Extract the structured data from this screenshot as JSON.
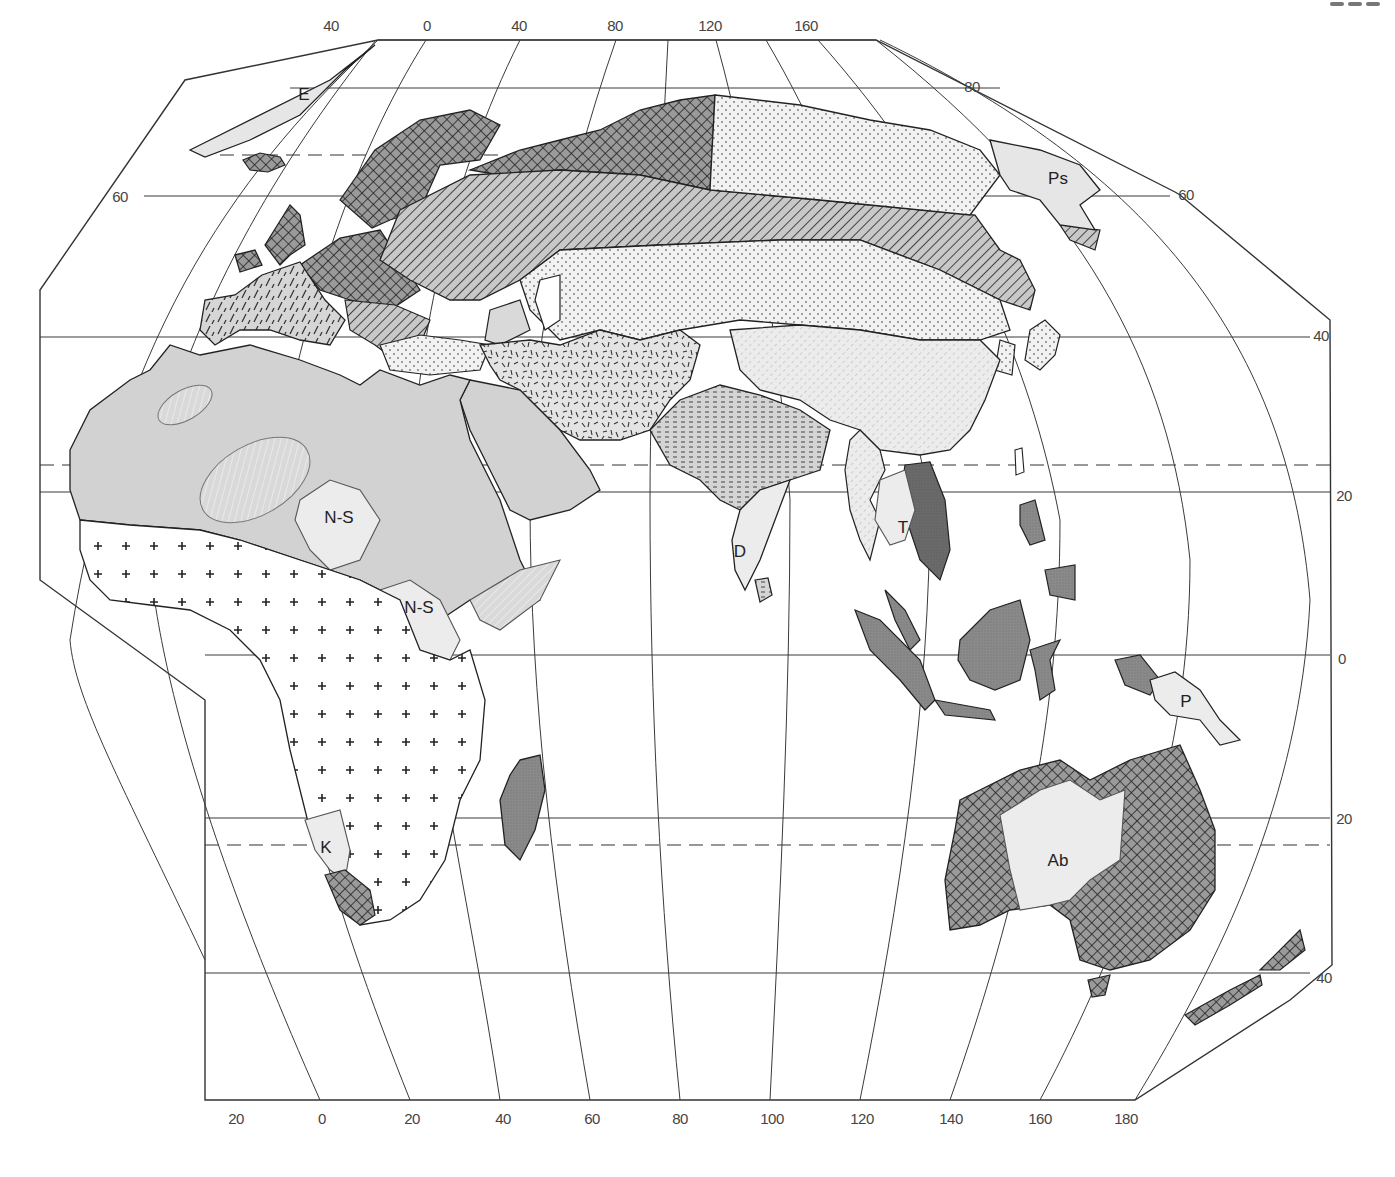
{
  "map": {
    "type": "thematic world-region map (Eastern Hemisphere)",
    "colors": {
      "outline": "#2b2b2b",
      "graticule": "#3a3a3a",
      "fill_light": "#ececec",
      "fill_mid": "#d2d2d2",
      "fill_dark": "#8c8c8c",
      "fill_darkest": "#6f6f6f",
      "paper": "#ffffff"
    },
    "top_longitude_labels": [
      "40",
      "0",
      "40",
      "80",
      "120",
      "160"
    ],
    "bottom_longitude_labels": [
      "20",
      "0",
      "20",
      "40",
      "60",
      "80",
      "100",
      "120",
      "140",
      "160",
      "180"
    ],
    "left_latitude_labels": [
      "60"
    ],
    "right_latitude_labels": [
      "80",
      "60",
      "40",
      "20",
      "0",
      "20",
      "40"
    ],
    "region_labels": [
      {
        "code": "E",
        "meaning_hint": "Greenland region"
      },
      {
        "code": "Ps",
        "meaning_hint": "Northeast Siberia region"
      },
      {
        "code": "N-S",
        "meaning_hint": "Central Sahel region"
      },
      {
        "code": "N-S",
        "meaning_hint": "Upper Nile region"
      },
      {
        "code": "D",
        "meaning_hint": "South India region"
      },
      {
        "code": "T",
        "meaning_hint": "Thailand region"
      },
      {
        "code": "P",
        "meaning_hint": "New Guinea region"
      },
      {
        "code": "K",
        "meaning_hint": "Kalahari region"
      },
      {
        "code": "Ab",
        "meaning_hint": "Central Australia region"
      }
    ],
    "fill_patterns": [
      "cross-hatch (NW Europe, N Russia coast, S Africa Cape, Australia coast, New Zealand)",
      "diagonal hatch (Russia / Central Europe band, Siberia Pacific coast)",
      "dashed slant (Western/Southern Europe)",
      "dotted (Siberia, Central Asia, Anatolia)",
      "random dashes (Iran, Afghanistan, Pakistan)",
      "horizontal dashes (North India)",
      "light slant hatch (China, Southeast Asia mainland)",
      "plain grey (North Africa, Arabia)",
      "plus signs (Sub-Saharan Africa)",
      "dark stipple (Indochina coast, Indonesia, Philippines, Madagascar)",
      "light plain (labelled enclaves E, Ps, N-S, D, T, P, K, Ab)"
    ]
  }
}
